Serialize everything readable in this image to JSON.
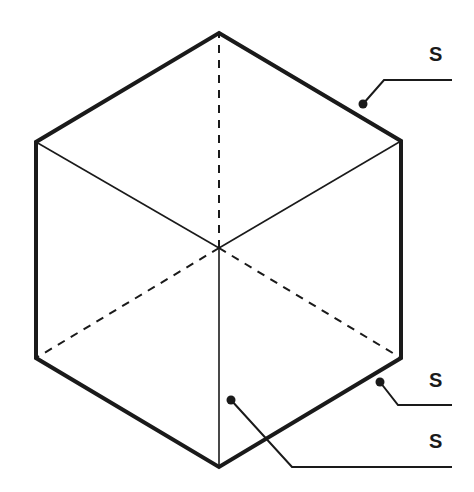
{
  "diagram": {
    "type": "isometric-cube",
    "colors": {
      "stroke": "#1a1a1a",
      "background": "#ffffff"
    },
    "vertices": {
      "top": [
        219,
        33
      ],
      "upper_left": [
        36,
        142
      ],
      "upper_right": [
        401,
        141
      ],
      "lower_left": [
        36,
        358
      ],
      "lower_right": [
        401,
        358
      ],
      "bottom": [
        219,
        467
      ],
      "center": [
        219,
        248
      ]
    },
    "callouts": [
      {
        "label": "S",
        "target": "outer edge (upper right)",
        "dot": [
          363,
          104
        ],
        "bend": [
          384,
          80
        ],
        "end": [
          452,
          80
        ],
        "label_pos": [
          436,
          60
        ]
      },
      {
        "label": "S",
        "target": "outer edge (lower right)",
        "dot": [
          380,
          382
        ],
        "bend": [
          398,
          405
        ],
        "end": [
          452,
          405
        ],
        "label_pos": [
          437,
          387
        ]
      },
      {
        "label": "S",
        "target": "front face (lower left)",
        "dot": [
          231,
          400
        ],
        "bend": [
          292,
          467
        ],
        "end": [
          452,
          467
        ],
        "label_pos": [
          437,
          448
        ]
      }
    ]
  }
}
